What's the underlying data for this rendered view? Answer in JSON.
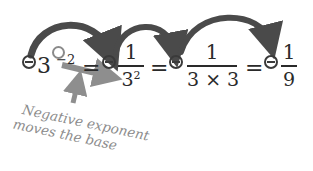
{
  "diagram": {
    "equation": {
      "terms": [
        {
          "sign": "minus-circled",
          "base": "3",
          "exponent": "−2"
        },
        {
          "sign": "minus-circled",
          "numerator": "1",
          "denominator_base": "3",
          "denominator_exponent": "2"
        },
        {
          "sign": "minus-circled",
          "numerator": "1",
          "denominator": "3 × 3"
        },
        {
          "sign": "minus-circled",
          "numerator": "1",
          "denominator": "9"
        }
      ],
      "equals": "="
    },
    "annotation": {
      "line1": "Negative",
      "line2": "exponent",
      "line3": "moves the base",
      "full": "Negative exponent moves the base"
    },
    "colors": {
      "text": "#2a2a2a",
      "arrow_dark": "#4a4a4a",
      "arrow_light": "#8e8e8e",
      "annotation": "#8c8c8c",
      "background": "#ffffff"
    }
  }
}
